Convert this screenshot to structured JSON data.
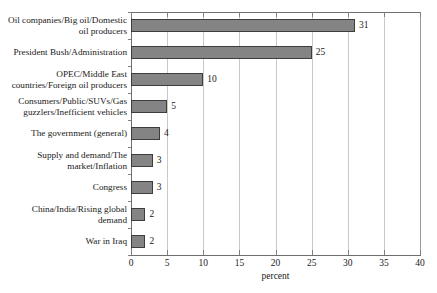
{
  "chart_data": {
    "type": "bar",
    "orientation": "horizontal",
    "title": "",
    "xlabel": "percent",
    "ylabel": "",
    "xlim": [
      0,
      40
    ],
    "xticks": [
      0,
      5,
      10,
      15,
      20,
      25,
      30,
      35,
      40
    ],
    "grid": true,
    "legend": false,
    "categories": [
      "Oil companies/Big oil/Domestic oil producers",
      "President Bush/Administration",
      "OPEC/Middle East countries/Foreign oil producers",
      "Consumers/Public/SUVs/Gas guzzlers/Inefficient vehicles",
      "The government (general)",
      "Supply and demand/The market/Inflation",
      "Congress",
      "China/India/Rising global demand",
      "War in Iraq"
    ],
    "category_lines": [
      [
        "Oil companies/Big oil/Domestic",
        "oil producers"
      ],
      [
        "President Bush/Administration"
      ],
      [
        "OPEC/Middle East",
        "countries/Foreign oil producers"
      ],
      [
        "Consumers/Public/SUVs/Gas",
        "guzzlers/Inefficient vehicles"
      ],
      [
        "The government (general)"
      ],
      [
        "Supply and demand/The",
        "market/Inflation"
      ],
      [
        "Congress"
      ],
      [
        "China/India/Rising global",
        "demand"
      ],
      [
        "War in Iraq"
      ]
    ],
    "values": [
      31,
      25,
      10,
      5,
      4,
      3,
      3,
      2,
      2
    ],
    "value_labels": [
      "31",
      "25",
      "10",
      "5",
      "4",
      "3",
      "3",
      "2",
      "2"
    ],
    "colors": {
      "bar_fill": "#848484",
      "bar_border": "#3d3d3d",
      "gridline": "#c9c9c9",
      "axis": "#6f6f6f",
      "text": "#1a1a1a",
      "background": "#ffffff"
    }
  }
}
